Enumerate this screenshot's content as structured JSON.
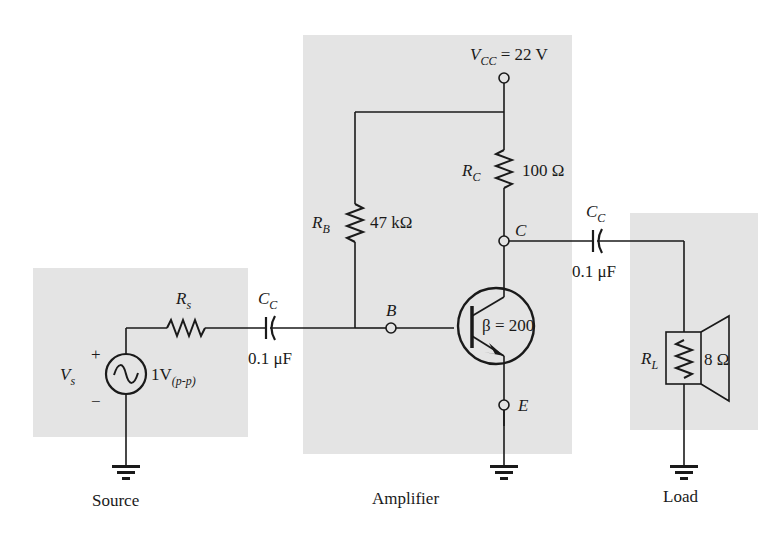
{
  "diagram": {
    "sections": [
      {
        "id": "source",
        "caption": "Source"
      },
      {
        "id": "amplifier",
        "caption": "Amplifier"
      },
      {
        "id": "load",
        "caption": "Load"
      }
    ],
    "source": {
      "vs_label": "V",
      "vs_sub": "s",
      "vs_value": "1V",
      "vs_value_sub": "(p-p)",
      "plus": "+",
      "minus": "−",
      "rs_label": "R",
      "rs_sub": "s"
    },
    "input_cap": {
      "label": "C",
      "sub": "C",
      "value": "0.1 μF"
    },
    "amplifier": {
      "vcc_label": "V",
      "vcc_sub": "CC",
      "vcc_value": "= 22 V",
      "rc_label": "R",
      "rc_sub": "C",
      "rc_value": "100 Ω",
      "rb_label": "R",
      "rb_sub": "B",
      "rb_value": "47 kΩ",
      "node_b": "B",
      "node_c": "C",
      "node_e": "E",
      "beta": "β = 200"
    },
    "output_cap": {
      "label": "C",
      "sub": "C",
      "value": "0.1 μF"
    },
    "load": {
      "rl_label": "R",
      "rl_sub": "L",
      "rl_value": "8 Ω"
    },
    "colors": {
      "panel": "#e4e4e4",
      "wire": "#1a1a1a",
      "background": "#ffffff"
    }
  }
}
